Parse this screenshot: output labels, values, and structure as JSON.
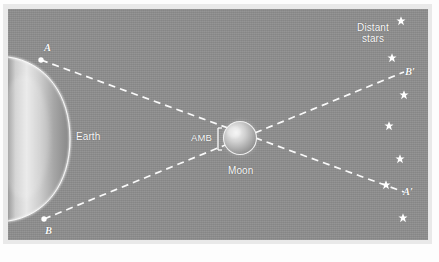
{
  "figure": {
    "background_color": "#8e8e8e",
    "mat_color": "#e9e9e9",
    "line_color": "#f7f7f7"
  },
  "labels": {
    "point_a": "A",
    "point_b": "B",
    "point_a_prime": "A′",
    "point_b_prime": "B′",
    "earth": "Earth",
    "moon": "Moon",
    "amb": "AMB",
    "distant_stars": "Distant\nstars"
  },
  "diagram_data": {
    "type": "ray-diagram",
    "bodies": [
      {
        "name": "Earth",
        "shape": "crescent-limb",
        "cx": 8,
        "cy": 139,
        "rx": 58,
        "ry": 82
      },
      {
        "name": "Moon",
        "shape": "sphere",
        "cx": 240,
        "cy": 138,
        "r": 17
      }
    ],
    "observer_points": [
      {
        "name": "A",
        "x": 41,
        "y": 60
      },
      {
        "name": "B",
        "x": 44,
        "y": 219
      }
    ],
    "sight_lines": [
      {
        "from": "A",
        "to": "A′",
        "x1": 41,
        "y1": 60,
        "x2": 404,
        "y2": 192,
        "style": "dashed"
      },
      {
        "from": "B",
        "to": "B′",
        "x1": 44,
        "y1": 219,
        "x2": 404,
        "y2": 72,
        "style": "dashed"
      }
    ],
    "star_field": [
      {
        "x": 401,
        "y": 21
      },
      {
        "x": 392,
        "y": 58
      },
      {
        "x": 404,
        "y": 95
      },
      {
        "x": 389,
        "y": 126
      },
      {
        "x": 400,
        "y": 159
      },
      {
        "x": 386,
        "y": 185
      },
      {
        "x": 403,
        "y": 218
      }
    ],
    "annotation_brackets": [
      {
        "label": "AMB",
        "x": 217,
        "y_top": 127,
        "y_bottom": 150
      }
    ]
  }
}
